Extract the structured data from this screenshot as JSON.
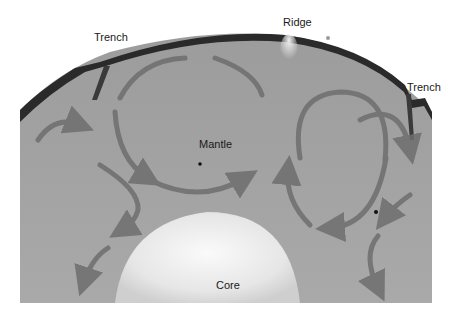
{
  "diagram": {
    "labels": {
      "trench_left": "Trench",
      "ridge": "Ridge",
      "trench_right": "Trench",
      "mantle": "Mantle",
      "core": "Core"
    },
    "colors": {
      "mantle": "#9a9a9a",
      "crust": "#2a2a2a",
      "core": "#e8e8e8",
      "arrow": "#6e6e6e",
      "background": "#ffffff"
    }
  }
}
